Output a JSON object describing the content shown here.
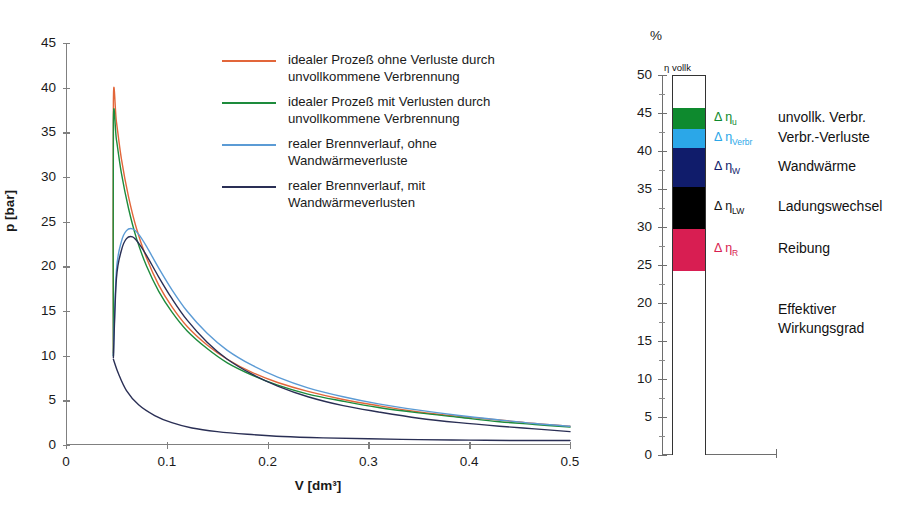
{
  "chart_data": [
    {
      "type": "line",
      "id": "pressure-volume-diagram",
      "title": "",
      "xlabel": "V [dm³]",
      "ylabel": "p [bar]",
      "xlim": [
        0,
        0.5
      ],
      "ylim": [
        0,
        45
      ],
      "xticks": [
        "0",
        "0.1",
        "0.2",
        "0.3",
        "0.4",
        "0.5"
      ],
      "xtick_values": [
        0,
        0.1,
        0.2,
        0.3,
        0.4,
        0.5
      ],
      "yticks": [
        "0",
        "5",
        "10",
        "15",
        "20",
        "25",
        "30",
        "35",
        "40",
        "45"
      ],
      "ytick_values": [
        0,
        5,
        10,
        15,
        20,
        25,
        30,
        35,
        40,
        45
      ],
      "grid": false,
      "legend_position": "upper-center",
      "series": [
        {
          "name": "idealer Prozeß ohne Verluste durch unvollkommene Verbrennung",
          "color": "#E2663A",
          "x": [
            0.047,
            0.047,
            0.05,
            0.055,
            0.062,
            0.07,
            0.08,
            0.092,
            0.105,
            0.12,
            0.14,
            0.16,
            0.185,
            0.21,
            0.24,
            0.275,
            0.31,
            0.35,
            0.39,
            0.43,
            0.465,
            0.5
          ],
          "y": [
            10.3,
            38.4,
            36.2,
            32.0,
            27.8,
            24.2,
            20.9,
            17.9,
            15.5,
            13.3,
            11.2,
            9.6,
            8.1,
            7.0,
            6.0,
            5.1,
            4.4,
            3.7,
            3.2,
            2.8,
            2.4,
            2.1
          ]
        },
        {
          "name": "idealer Prozeß mit Verlusten durch unvollkommene Verbrennung",
          "color": "#1D8B3C",
          "x": [
            0.047,
            0.047,
            0.05,
            0.055,
            0.062,
            0.07,
            0.08,
            0.092,
            0.105,
            0.12,
            0.14,
            0.16,
            0.185,
            0.21,
            0.24,
            0.275,
            0.31,
            0.35,
            0.39,
            0.43,
            0.465,
            0.5
          ],
          "y": [
            10.0,
            36.1,
            34.2,
            30.4,
            26.5,
            23.1,
            20.0,
            17.2,
            14.9,
            12.8,
            10.8,
            9.2,
            7.8,
            6.7,
            5.7,
            4.9,
            4.2,
            3.6,
            3.1,
            2.6,
            2.3,
            2.0
          ]
        },
        {
          "name": "realer Brennverlauf, ohne Wandwärmeverluste",
          "color": "#5B9BD5",
          "x": [
            0.047,
            0.05,
            0.055,
            0.06,
            0.066,
            0.072,
            0.08,
            0.092,
            0.105,
            0.12,
            0.14,
            0.16,
            0.185,
            0.21,
            0.24,
            0.275,
            0.31,
            0.35,
            0.39,
            0.43,
            0.465,
            0.5
          ],
          "y": [
            10.0,
            19.5,
            22.8,
            24.0,
            24.2,
            23.6,
            22.2,
            19.8,
            17.4,
            15.0,
            12.5,
            10.6,
            8.9,
            7.6,
            6.4,
            5.4,
            4.6,
            3.9,
            3.3,
            2.8,
            2.4,
            2.1
          ]
        },
        {
          "name": "realer Brennverlauf, mit Wandwärmeverlusten",
          "color": "#2A2F55",
          "x": [
            0.047,
            0.05,
            0.055,
            0.06,
            0.066,
            0.072,
            0.08,
            0.092,
            0.105,
            0.12,
            0.14,
            0.16,
            0.185,
            0.21,
            0.24,
            0.275,
            0.31,
            0.35,
            0.39,
            0.43,
            0.465,
            0.5
          ],
          "y": [
            9.8,
            18.6,
            21.8,
            23.1,
            23.3,
            22.6,
            21.2,
            18.8,
            16.4,
            14.0,
            11.5,
            9.6,
            7.9,
            6.6,
            5.4,
            4.4,
            3.7,
            3.0,
            2.5,
            2.1,
            1.8,
            1.5
          ]
        },
        {
          "name": "Niederdruckschleife",
          "color": "#2A2F55",
          "x": [
            0.047,
            0.052,
            0.06,
            0.072,
            0.088,
            0.105,
            0.125,
            0.15,
            0.18,
            0.215,
            0.255,
            0.3,
            0.35,
            0.4,
            0.45,
            0.5
          ],
          "y": [
            9.6,
            8.0,
            6.1,
            4.5,
            3.3,
            2.5,
            1.9,
            1.5,
            1.2,
            0.95,
            0.8,
            0.7,
            0.6,
            0.55,
            0.5,
            0.5
          ]
        }
      ]
    },
    {
      "type": "bar",
      "id": "efficiency-loss-breakdown",
      "orientation": "vertical-stacked",
      "unit_label": "%",
      "bar_caption": "η vollk",
      "ylim": [
        0,
        50
      ],
      "yticks": [
        "0",
        "5",
        "10",
        "15",
        "20",
        "25",
        "30",
        "35",
        "40",
        "45",
        "50"
      ],
      "ytick_values": [
        0,
        5,
        10,
        15,
        20,
        25,
        30,
        35,
        40,
        45,
        50
      ],
      "grid": false,
      "total_top": 45.8,
      "segments": [
        {
          "symbol": "Δ η",
          "subscript": "u",
          "label": "unvollk. Verbr.",
          "color": "#0E8A2E",
          "from": 43.0,
          "to": 45.8,
          "value": 2.8
        },
        {
          "symbol": "Δ η",
          "subscript": "Verbr",
          "label": "Verbr.-Verluste",
          "color": "#2BA7E8",
          "from": 40.5,
          "to": 43.0,
          "value": 2.5
        },
        {
          "symbol": "Δ η",
          "subscript": "W",
          "label": "Wandwärme",
          "color": "#101C6B",
          "from": 35.4,
          "to": 40.5,
          "value": 5.1
        },
        {
          "symbol": "Δ η",
          "subscript": "LW",
          "label": "Ladungswechsel",
          "color": "#000000",
          "from": 29.9,
          "to": 35.4,
          "value": 5.5
        },
        {
          "symbol": "Δ η",
          "subscript": "R",
          "label": "Reibung",
          "color": "#D81E52",
          "from": 24.3,
          "to": 29.9,
          "value": 5.6
        },
        {
          "symbol": "",
          "subscript": "",
          "label": "Effektiver Wirkungsgrad",
          "color": "#FFFFFF",
          "from": 0,
          "to": 24.3,
          "value": 24.3
        }
      ],
      "effective_efficiency_label_line1": "Effektiver",
      "effective_efficiency_label_line2": "Wirkungsgrad"
    }
  ],
  "colors": {
    "ideal_no_loss": "#E2663A",
    "ideal_with_loss": "#1D8B3C",
    "real_no_wall": "#5B9BD5",
    "real_with_wall": "#2A2F55",
    "axis": "#808080",
    "text": "#1a1a1a"
  }
}
